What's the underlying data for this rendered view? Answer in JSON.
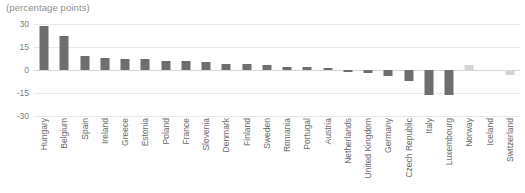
{
  "chart_data": {
    "type": "bar",
    "title": "(percentage points)",
    "xlabel": "",
    "ylabel": "",
    "ylim": [
      -30,
      30
    ],
    "yticks": [
      30,
      15,
      0,
      -15,
      -30
    ],
    "grid": true,
    "legend": false,
    "categories": [
      "Hungary",
      "Belgium",
      "Spain",
      "Ireland",
      "Greece",
      "Estonia",
      "Poland",
      "France",
      "Slovenia",
      "Denmark",
      "Finland",
      "Sweden",
      "Romania",
      "Portugal",
      "Austria",
      "Netherlands",
      "United Kingdom",
      "Germany",
      "Czech Republic",
      "Italy",
      "Luxembourg",
      "Norway",
      "Iceland",
      "Switzerland"
    ],
    "values": [
      29,
      22,
      9,
      8,
      7,
      7,
      6,
      6,
      5,
      4,
      4,
      3,
      2,
      2,
      1,
      -1,
      -2,
      -4,
      -7,
      -16,
      -16,
      3,
      0,
      -3
    ],
    "bar_colors": [
      "#6e6e6e",
      "#6e6e6e",
      "#6e6e6e",
      "#6e6e6e",
      "#6e6e6e",
      "#6e6e6e",
      "#6e6e6e",
      "#6e6e6e",
      "#6e6e6e",
      "#6e6e6e",
      "#6e6e6e",
      "#6e6e6e",
      "#6e6e6e",
      "#6e6e6e",
      "#6e6e6e",
      "#6e6e6e",
      "#6e6e6e",
      "#6e6e6e",
      "#6e6e6e",
      "#6e6e6e",
      "#6e6e6e",
      "#d4d4d4",
      "#d4d4d4",
      "#d4d4d4"
    ]
  },
  "colors": {
    "bar_primary": "#6e6e6e",
    "bar_secondary": "#d4d4d4",
    "gridline": "#e8e8e8",
    "zero_line": "#d8d8d8",
    "tick_text": "#7d7d7d",
    "category_text": "#6a6a6a",
    "title_text": "#8d8d8d",
    "background": "#ffffff"
  }
}
